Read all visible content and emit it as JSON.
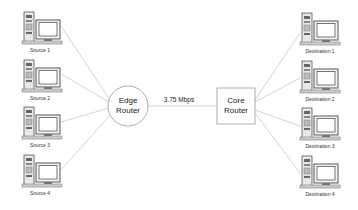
{
  "diagram": {
    "sources": [
      {
        "label": "Source 1"
      },
      {
        "label": "Source 2"
      },
      {
        "label": "Source 3"
      },
      {
        "label": "Source 4"
      }
    ],
    "destinations": [
      {
        "label": "Destination 1"
      },
      {
        "label": "Destination 2"
      },
      {
        "label": "Destination 3"
      },
      {
        "label": "Destination 4"
      }
    ],
    "edge_router": {
      "line1": "Edge",
      "line2": "Router"
    },
    "core_router": {
      "line1": "Core",
      "line2": "Router"
    },
    "link": {
      "label": "3.75 Mbps"
    },
    "colors": {
      "line": "#b0b0b0",
      "stroke": "#999999",
      "computer": "#555555"
    }
  }
}
